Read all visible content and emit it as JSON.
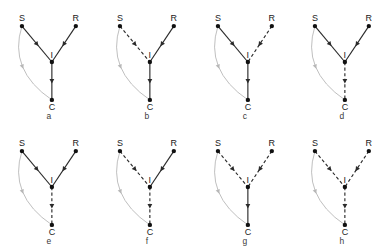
{
  "figure": {
    "node_labels": {
      "source": "S",
      "receiver": "R",
      "intermediate": "I",
      "outcome": "C"
    },
    "colors": {
      "node": "#111111",
      "edge": "#2b2b2b",
      "arc": "#b7b7b7",
      "background": "#ffffff",
      "text": "#1a1a1a"
    },
    "geometry": {
      "node_positions": {
        "S": {
          "x": 22,
          "y": 26
        },
        "R": {
          "x": 76,
          "y": 26
        },
        "I": {
          "x": 52,
          "y": 62
        },
        "C": {
          "x": 52,
          "y": 100
        }
      },
      "arc_control": {
        "x": 8,
        "y": 70
      }
    },
    "panels": [
      {
        "caption": "a",
        "edges": {
          "S_to_I": {
            "style": "solid",
            "label": "S to I"
          },
          "R_to_I": {
            "style": "solid",
            "label": "R to I"
          },
          "I_to_C": {
            "style": "solid",
            "label": "I to C"
          },
          "S_to_C_arc": {
            "style": "arc",
            "label": "S to C"
          }
        }
      },
      {
        "caption": "b",
        "edges": {
          "S_to_I": {
            "style": "dashed",
            "label": "S to I"
          },
          "R_to_I": {
            "style": "solid",
            "label": "R to I"
          },
          "I_to_C": {
            "style": "solid",
            "label": "I to C"
          },
          "S_to_C_arc": {
            "style": "arc",
            "label": "S to C"
          }
        }
      },
      {
        "caption": "c",
        "edges": {
          "S_to_I": {
            "style": "solid",
            "label": "S to I"
          },
          "R_to_I": {
            "style": "dashed",
            "label": "R to I"
          },
          "I_to_C": {
            "style": "solid",
            "label": "I to C"
          },
          "S_to_C_arc": {
            "style": "arc",
            "label": "S to C"
          }
        }
      },
      {
        "caption": "d",
        "edges": {
          "S_to_I": {
            "style": "solid",
            "label": "S to I"
          },
          "R_to_I": {
            "style": "solid",
            "label": "R to I"
          },
          "I_to_C": {
            "style": "dashed",
            "label": "I to C"
          },
          "S_to_C_arc": {
            "style": "arc",
            "label": "S to C"
          }
        }
      },
      {
        "caption": "e",
        "edges": {
          "S_to_I": {
            "style": "solid",
            "label": "S to I"
          },
          "R_to_I": {
            "style": "solid",
            "label": "R to I"
          },
          "I_to_C": {
            "style": "dashed",
            "label": "I to C"
          },
          "S_to_C_arc": {
            "style": "arc",
            "label": "S to C"
          }
        }
      },
      {
        "caption": "f",
        "edges": {
          "S_to_I": {
            "style": "dashed",
            "label": "S to I"
          },
          "R_to_I": {
            "style": "solid",
            "label": "R to I"
          },
          "I_to_C": {
            "style": "dashed",
            "label": "I to C"
          },
          "S_to_C_arc": {
            "style": "arc",
            "label": "S to C"
          }
        }
      },
      {
        "caption": "g",
        "edges": {
          "S_to_I": {
            "style": "dashed",
            "label": "S to I"
          },
          "R_to_I": {
            "style": "dashed",
            "label": "R to I"
          },
          "I_to_C": {
            "style": "solid",
            "label": "I to C"
          },
          "S_to_C_arc": {
            "style": "arc",
            "label": "S to C"
          }
        }
      },
      {
        "caption": "h",
        "edges": {
          "S_to_I": {
            "style": "dashed",
            "label": "S to I"
          },
          "R_to_I": {
            "style": "dashed",
            "label": "R to I"
          },
          "I_to_C": {
            "style": "dashed",
            "label": "I to C"
          },
          "S_to_C_arc": {
            "style": "arc",
            "label": "S to C"
          }
        }
      }
    ]
  }
}
